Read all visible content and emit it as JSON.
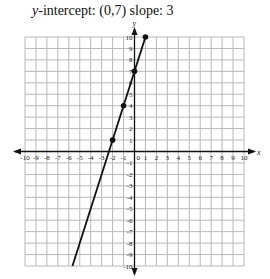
{
  "title": {
    "var": "y",
    "rest": "-intercept: (0,7) slope: 3"
  },
  "chart_data": {
    "type": "line",
    "title": "y-intercept: (0,7) slope: 3",
    "xlabel": "x",
    "ylabel": "y",
    "xlim": [
      -10,
      10
    ],
    "ylim": [
      -10,
      10
    ],
    "grid": true,
    "x_ticks": [
      -10,
      -9,
      -8,
      -7,
      -6,
      -5,
      -4,
      -3,
      -2,
      -1,
      0,
      1,
      2,
      3,
      4,
      5,
      6,
      7,
      8,
      9,
      10
    ],
    "y_ticks": [
      -10,
      -9,
      -8,
      -7,
      -6,
      -5,
      -4,
      -3,
      -2,
      -1,
      1,
      2,
      3,
      4,
      5,
      6,
      7,
      8,
      9,
      10
    ],
    "series": [
      {
        "name": "y = 3x + 7",
        "slope": 3,
        "intercept": 7,
        "line_from": [
          -5.667,
          -10
        ],
        "line_to": [
          1,
          10
        ],
        "points": [
          [
            -2,
            1
          ],
          [
            -1,
            4
          ],
          [
            0,
            7
          ],
          [
            1,
            10
          ]
        ]
      }
    ]
  }
}
